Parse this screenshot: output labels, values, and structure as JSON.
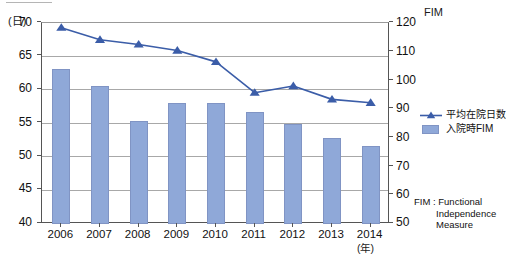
{
  "chart_data": {
    "type": "bar",
    "title": "",
    "subtitle": "",
    "xlabel": "(年)",
    "ylabel": "(日)",
    "y2label": "FIM",
    "categories": [
      "2006",
      "2007",
      "2008",
      "2009",
      "2010",
      "2011",
      "2012",
      "2013",
      "2014"
    ],
    "ylim": [
      40,
      70
    ],
    "y2lim": [
      50,
      120
    ],
    "yticks": [
      "70",
      "65",
      "60",
      "55",
      "50",
      "45",
      "40"
    ],
    "y2ticks": [
      "120",
      "110",
      "100",
      "90",
      "80",
      "70",
      "60",
      "50"
    ],
    "grid": true,
    "legend_position": "right",
    "series": [
      {
        "name": "平均在院日数",
        "type": "line",
        "axis": "left",
        "color": "#3b5da8",
        "marker": "triangle",
        "values": [
          69.3,
          67.5,
          66.8,
          65.9,
          64.2,
          59.6,
          60.6,
          58.6,
          58.1
        ]
      },
      {
        "name": "入院時FIM",
        "type": "bar",
        "axis": "right",
        "color": "#8fa8d8",
        "values": [
          104,
          98,
          86,
          92,
          92,
          89,
          85,
          80,
          77
        ]
      }
    ],
    "annotations": [
      "FIM : Functional",
      "Independence",
      "Measure"
    ]
  },
  "footnote": {
    "line1": "FIM : Functional",
    "line2": "Independence",
    "line3": "Measure"
  }
}
